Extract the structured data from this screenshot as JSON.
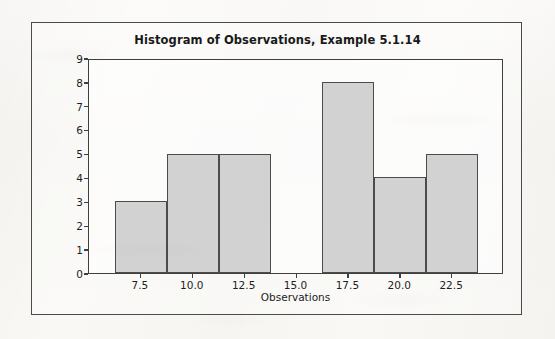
{
  "figure": {
    "title": "Histogram of Observations, Example 5.1.14",
    "frame_color": "#4a4a4a",
    "plot_border_color": "#3f3f3f",
    "bar_fill_color": "#d2d2d2",
    "bar_border_color": "#4c4c4c",
    "background_color": "#f7f6f3"
  },
  "chart_data": {
    "type": "bar",
    "title": "Histogram of Observations, Example 5.1.14",
    "xlabel": "Observations",
    "ylabel": "Frequency",
    "grid": false,
    "legend": null,
    "bin_width": 2.5,
    "bin_edges": [
      6.25,
      8.75,
      11.25,
      13.75,
      16.25,
      18.75,
      21.25,
      23.75
    ],
    "bin_centers": [
      7.5,
      10.0,
      12.5,
      15.0,
      17.5,
      20.0,
      22.5
    ],
    "categories": [
      "7.5",
      "10.0",
      "12.5",
      "15.0",
      "17.5",
      "20.0",
      "22.5"
    ],
    "values": [
      3,
      5,
      5,
      0,
      8,
      4,
      5
    ],
    "xlim": [
      5.0,
      25.0
    ],
    "ylim": [
      0,
      9
    ],
    "xticks": [
      7.5,
      10.0,
      12.5,
      15.0,
      17.5,
      20.0,
      22.5
    ],
    "xtick_labels": [
      "7.5",
      "10.0",
      "12.5",
      "15.0",
      "17.5",
      "20.0",
      "22.5"
    ],
    "yticks": [
      0,
      1,
      2,
      3,
      4,
      5,
      6,
      7,
      8,
      9
    ],
    "ytick_labels": [
      "0",
      "1",
      "2",
      "3",
      "4",
      "5",
      "6",
      "7",
      "8",
      "9"
    ]
  }
}
